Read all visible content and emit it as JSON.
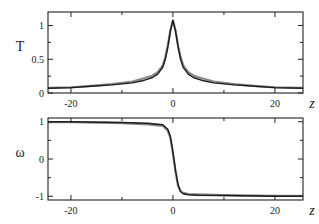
{
  "chart_data": [
    {
      "type": "line",
      "panel": "top",
      "ylabel": "T",
      "xlabel": "z",
      "xlim": [
        -24.5,
        25.5
      ],
      "ylim": [
        0,
        1.2
      ],
      "xticks": [
        -20,
        0,
        20
      ],
      "xticks_minor": [
        -10,
        10
      ],
      "yticks": [
        0,
        0.5,
        1
      ],
      "yticks_labels": [
        "0",
        "0.5",
        "1"
      ],
      "yticks_minor": [
        0.25,
        0.75
      ],
      "grid": false,
      "series": [
        {
          "name": "T (dark)",
          "color": "#1a1a1a",
          "x": [
            -24.5,
            -20,
            -16,
            -12,
            -8,
            -6,
            -4,
            -3,
            -2,
            -1.5,
            -1,
            -0.5,
            0,
            0.5,
            1,
            1.5,
            2,
            3,
            4,
            6,
            8,
            12,
            16,
            20,
            25.5
          ],
          "y": [
            0.07,
            0.08,
            0.1,
            0.12,
            0.15,
            0.18,
            0.23,
            0.28,
            0.38,
            0.5,
            0.68,
            0.92,
            1.08,
            0.92,
            0.68,
            0.5,
            0.38,
            0.28,
            0.23,
            0.18,
            0.15,
            0.12,
            0.1,
            0.08,
            0.07
          ]
        },
        {
          "name": "T (gray)",
          "color": "#8a8a8a",
          "x": [
            -24.5,
            -20,
            -16,
            -12,
            -8,
            -6,
            -4,
            -3,
            -2,
            -1.5,
            -1,
            -0.5,
            0,
            0.5,
            1,
            1.5,
            2,
            3,
            4,
            6,
            8,
            12,
            16,
            20,
            25.5
          ],
          "y": [
            0.075,
            0.085,
            0.105,
            0.13,
            0.17,
            0.21,
            0.26,
            0.31,
            0.41,
            0.53,
            0.7,
            0.93,
            1.07,
            0.93,
            0.7,
            0.53,
            0.41,
            0.31,
            0.26,
            0.21,
            0.17,
            0.13,
            0.105,
            0.085,
            0.075
          ]
        }
      ]
    },
    {
      "type": "line",
      "panel": "bottom",
      "ylabel": "ω",
      "xlabel": "z",
      "xlim": [
        -24.5,
        25.5
      ],
      "ylim": [
        -1.1,
        1.1
      ],
      "xticks": [
        -20,
        0,
        20
      ],
      "xticks_minor": [
        -10,
        10
      ],
      "yticks": [
        -1,
        0,
        1
      ],
      "yticks_labels": [
        "-1",
        "0",
        "1"
      ],
      "yticks_minor": [
        -0.5,
        0.5
      ],
      "grid": false,
      "series": [
        {
          "name": "ω (dark)",
          "color": "#1a1a1a",
          "x": [
            -24.5,
            -20,
            -10,
            -5,
            -2,
            -1,
            -0.5,
            0,
            0.5,
            1,
            1.5,
            2,
            3,
            5,
            10,
            20,
            25.5
          ],
          "y": [
            1.0,
            1.0,
            0.98,
            0.96,
            0.92,
            0.8,
            0.6,
            0.2,
            -0.3,
            -0.7,
            -0.88,
            -0.93,
            -0.96,
            -0.97,
            -0.98,
            -1.0,
            -1.0
          ]
        },
        {
          "name": "ω (gray)",
          "color": "#8a8a8a",
          "x": [
            -24.5,
            -20,
            -10,
            -5,
            -2,
            -1,
            -0.5,
            0,
            0.5,
            1,
            1.5,
            2,
            3,
            5,
            10,
            20,
            25.5
          ],
          "y": [
            0.99,
            0.99,
            0.96,
            0.93,
            0.89,
            0.76,
            0.56,
            0.15,
            -0.34,
            -0.72,
            -0.86,
            -0.91,
            -0.94,
            -0.95,
            -0.97,
            -0.99,
            -0.99
          ]
        }
      ]
    }
  ]
}
